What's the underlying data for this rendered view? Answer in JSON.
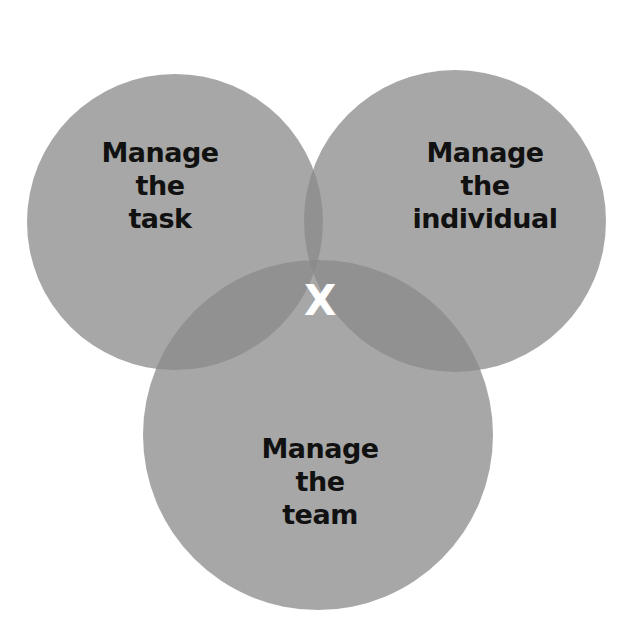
{
  "diagram": {
    "type": "venn",
    "circles": [
      {
        "id": "task",
        "lines": [
          "Manage",
          "the",
          "task"
        ]
      },
      {
        "id": "individual",
        "lines": [
          "Manage",
          "the",
          "individual"
        ]
      },
      {
        "id": "team",
        "lines": [
          "Manage",
          "the",
          "team"
        ]
      }
    ],
    "center_label": "X",
    "colors": {
      "circle_fill": "#9a9a9a",
      "text": "#111111",
      "center_text": "#ffffff"
    }
  }
}
